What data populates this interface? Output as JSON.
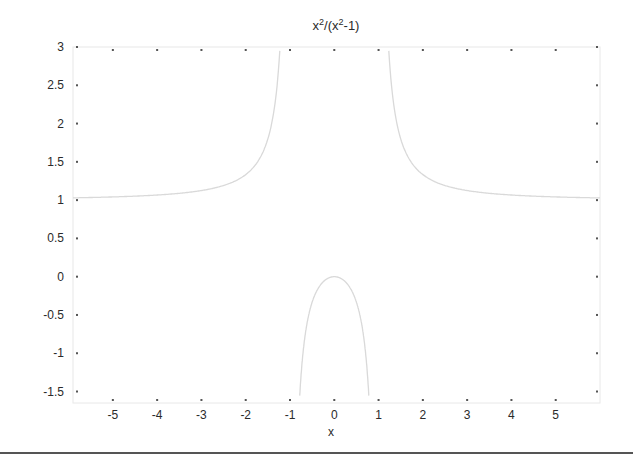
{
  "chart_data": {
    "type": "line",
    "title_parts": {
      "base1": "x",
      "sup1": "2",
      "mid": "/(x",
      "sup2": "2",
      "tail": "-1)"
    },
    "xlabel": "x",
    "ylabel": "",
    "function": "x^2/(x^2-1)",
    "xlim": [
      -5.9,
      6.0
    ],
    "ylim": [
      -1.65,
      3.0
    ],
    "xticks": [
      -5,
      -4,
      -3,
      -2,
      -1,
      0,
      1,
      2,
      3,
      4,
      5
    ],
    "xtick_labels": [
      "-5",
      "-4",
      "-3",
      "-2",
      "-1",
      "0",
      "1",
      "2",
      "3",
      "4",
      "5"
    ],
    "yticks": [
      3,
      2.5,
      2,
      1.5,
      1,
      0.5,
      0,
      -0.5,
      -1,
      -1.5
    ],
    "ytick_labels": [
      "3",
      "2.5",
      "2",
      "1.5",
      "1",
      "0.5",
      "0",
      "-0.5",
      "-1",
      "-1.5"
    ],
    "grid": false,
    "legend": null,
    "series": [
      {
        "name": "left branch",
        "x": [
          -5.9,
          -5,
          -4,
          -3,
          -2,
          -1.5,
          -1.3,
          -1.23
        ],
        "y": [
          1.029,
          1.042,
          1.067,
          1.125,
          1.333,
          1.8,
          2.449,
          2.95
        ]
      },
      {
        "name": "middle branch",
        "x": [
          -0.78,
          -0.6,
          -0.4,
          -0.2,
          0,
          0.2,
          0.4,
          0.6,
          0.78
        ],
        "y": [
          -1.55,
          -0.5625,
          -0.19,
          -0.0417,
          0,
          -0.0417,
          -0.19,
          -0.5625,
          -1.55
        ]
      },
      {
        "name": "right branch",
        "x": [
          1.23,
          1.3,
          1.5,
          2,
          3,
          4,
          5,
          6
        ],
        "y": [
          2.95,
          2.449,
          1.8,
          1.333,
          1.125,
          1.067,
          1.042,
          1.029
        ]
      }
    ],
    "colors": {
      "curve": "#d9d9d9",
      "axes": "#e6e6e6",
      "ticks": "#555555",
      "text": "#2a2a2a"
    }
  }
}
